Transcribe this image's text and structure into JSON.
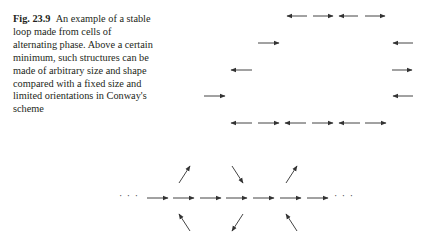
{
  "figure": {
    "label": "Fig. 23.9",
    "caption": "An example of a stable loop made from cells of alternating phase. Above a certain minimum, such structures can be made of arbitrary size and shape compared with a fixed size and limited orientations in Conway's scheme"
  },
  "loop_diagram": {
    "arrows": [
      {
        "x1": 307,
        "y": 16,
        "x2": 287
      },
      {
        "x1": 313,
        "y": 16,
        "x2": 333
      },
      {
        "x1": 358,
        "y": 16,
        "x2": 339
      },
      {
        "x1": 365,
        "y": 16,
        "x2": 385
      },
      {
        "x1": 258,
        "y": 43,
        "x2": 279
      },
      {
        "x1": 413,
        "y": 43,
        "x2": 393
      },
      {
        "x1": 252,
        "y": 70,
        "x2": 231
      },
      {
        "x1": 392,
        "y": 70,
        "x2": 412
      },
      {
        "x1": 204,
        "y": 96,
        "x2": 225
      },
      {
        "x1": 413,
        "y": 96,
        "x2": 393
      },
      {
        "x1": 252,
        "y": 123,
        "x2": 231
      },
      {
        "x1": 258,
        "y": 123,
        "x2": 279
      },
      {
        "x1": 306,
        "y": 123,
        "x2": 285
      },
      {
        "x1": 312,
        "y": 123,
        "x2": 333
      },
      {
        "x1": 360,
        "y": 123,
        "x2": 339
      },
      {
        "x1": 365,
        "y": 123,
        "x2": 386
      }
    ]
  },
  "chain_diagram": {
    "leading_dots": "· · ·",
    "trailing_dots": "· · ·",
    "row_arrows": [
      [
        147,
        168
      ],
      [
        173,
        194
      ],
      [
        200,
        221
      ],
      [
        226,
        247
      ],
      [
        253,
        274
      ],
      [
        280,
        301
      ],
      [
        307,
        328
      ]
    ],
    "diagonal_arrows": [
      {
        "x1": 179,
        "y1": 183,
        "x2": 190,
        "y2": 166
      },
      {
        "x1": 232,
        "y1": 166,
        "x2": 243,
        "y2": 183
      },
      {
        "x1": 286,
        "y1": 183,
        "x2": 297,
        "y2": 166
      },
      {
        "x1": 190,
        "y1": 231,
        "x2": 179,
        "y2": 214
      },
      {
        "x1": 243,
        "y1": 214,
        "x2": 232,
        "y2": 231
      },
      {
        "x1": 297,
        "y1": 231,
        "x2": 286,
        "y2": 214
      }
    ]
  }
}
